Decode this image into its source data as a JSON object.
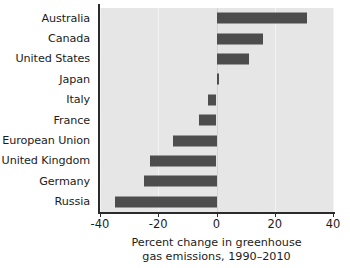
{
  "chart_data": {
    "type": "bar",
    "orientation": "horizontal",
    "title": "",
    "xlabel": "Percent change in greenhouse gas emissions, 1990–2010",
    "ylabel": "",
    "categories": [
      "Australia",
      "Canada",
      "United States",
      "Japan",
      "Italy",
      "France",
      "European Union",
      "United Kingdom",
      "Germany",
      "Russia"
    ],
    "values": [
      31,
      16,
      11,
      1,
      -3,
      -6,
      -15,
      -23,
      -25,
      -35
    ],
    "xlim": [
      -40,
      40
    ],
    "xticks": [
      -40,
      -20,
      0,
      20,
      40
    ],
    "xtick_labels": [
      "-40",
      "-20",
      "0",
      "20",
      "40"
    ],
    "grid": true,
    "legend": "none",
    "bar_color": "#4d4d4d",
    "plot_background": "#e6e6e6"
  },
  "axis_title_lines": [
    "Percent change in greenhouse",
    "gas emissions, 1990–2010"
  ]
}
